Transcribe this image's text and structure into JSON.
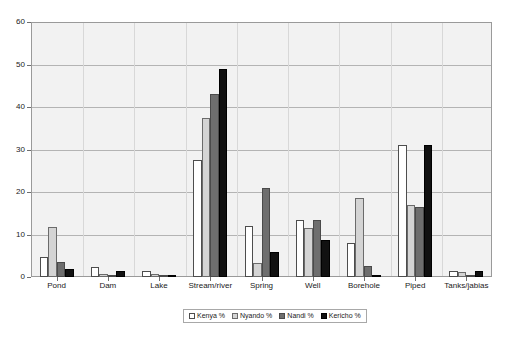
{
  "chart_data": {
    "type": "bar",
    "title": "",
    "subtitle": "",
    "xlabel": "",
    "ylabel": "",
    "ylim": [
      0,
      60
    ],
    "yticks": [
      0,
      10,
      20,
      30,
      40,
      50,
      60
    ],
    "grid": "horizontal",
    "legend_position": "bottom",
    "categories": [
      "Pond",
      "Dam",
      "Lake",
      "Stream/river",
      "Spring",
      "Well",
      "Borehole",
      "Piped",
      "Tanks/jabias"
    ],
    "series": [
      {
        "name": "Kenya %",
        "color": "#ffffff",
        "values": [
          4.7,
          2.3,
          1.5,
          27.5,
          12.0,
          13.5,
          8.0,
          31.0,
          1.5
        ]
      },
      {
        "name": "Nyando %",
        "color": "#d4d4d4",
        "values": [
          11.8,
          0.6,
          0.8,
          37.5,
          3.3,
          11.5,
          18.5,
          17.0,
          1.2
        ]
      },
      {
        "name": "Nandi %",
        "color": "#6e6e6e",
        "values": [
          3.5,
          0.4,
          0.2,
          43.0,
          21.0,
          13.5,
          2.5,
          16.5,
          0.3
        ]
      },
      {
        "name": "Kericho %",
        "color": "#111111",
        "values": [
          1.9,
          1.3,
          0.1,
          49.0,
          6.0,
          8.7,
          0.1,
          31.0,
          1.3
        ]
      }
    ]
  },
  "legend": {
    "items": [
      {
        "label": "Kenya %"
      },
      {
        "label": "Nyando %"
      },
      {
        "label": "Nandi %"
      },
      {
        "label": "Kericho %"
      }
    ]
  }
}
